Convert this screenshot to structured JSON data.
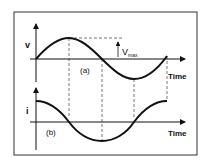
{
  "diagram": {
    "top_graph": {
      "axis_label": "v",
      "panel_label": "(a)",
      "time_label": "Time",
      "amplitude_label": "V",
      "amplitude_subscript": "max",
      "waveform": "sine"
    },
    "bottom_graph": {
      "axis_label": "i",
      "panel_label": "(b)",
      "time_label": "Time",
      "waveform": "cosine"
    },
    "colors": {
      "line": "#111111",
      "dashed": "#555555",
      "frame": "#333333",
      "background": "#ffffff"
    }
  }
}
